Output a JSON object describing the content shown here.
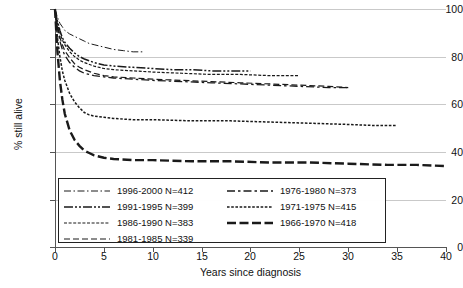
{
  "chart_data": {
    "type": "line",
    "title": "",
    "xlabel": "Years since diagnosis",
    "ylabel": "% still alive",
    "xlim": [
      0,
      40
    ],
    "ylim": [
      0,
      100
    ],
    "xticks": [
      0,
      5,
      10,
      15,
      20,
      25,
      30,
      35,
      40
    ],
    "yticks": [
      0,
      20,
      40,
      60,
      80,
      100
    ],
    "grid": "horizontal",
    "legend_position": "lower-left-inside",
    "series": [
      {
        "name": "1996-2000 N=412",
        "period": "1996-2000",
        "n": 412,
        "dash": "dash-dot-long",
        "x": [
          0,
          0.25,
          0.5,
          0.75,
          1,
          1.5,
          2,
          2.5,
          3,
          3.5,
          4,
          5,
          6,
          7,
          8,
          9
        ],
        "y": [
          100,
          96.5,
          94,
          92.5,
          91,
          89.5,
          88.5,
          87.5,
          86.5,
          85.5,
          85,
          84,
          83,
          82.5,
          82,
          82
        ]
      },
      {
        "name": "1991-1995 N=399",
        "period": "1991-1995",
        "n": 399,
        "dash": "long-dash-dot",
        "x": [
          0,
          0.25,
          0.5,
          0.75,
          1,
          1.5,
          2,
          2.5,
          3,
          4,
          5,
          6,
          8,
          10,
          12,
          14,
          16,
          18,
          20
        ],
        "y": [
          100,
          95,
          91,
          88,
          86,
          83.5,
          81.5,
          80,
          79,
          77.5,
          76.5,
          76,
          75.5,
          75,
          74.5,
          74.5,
          74,
          74,
          74
        ]
      },
      {
        "name": "1986-1990 N=383",
        "period": "1986-1990",
        "n": 383,
        "dash": "dot-dash-fine",
        "x": [
          0,
          0.25,
          0.5,
          0.75,
          1,
          1.5,
          2,
          2.5,
          3,
          4,
          5,
          6,
          8,
          10,
          13,
          16,
          19,
          22,
          25
        ],
        "y": [
          100,
          94,
          90,
          87,
          85,
          82,
          80,
          78.5,
          77.5,
          76,
          75,
          74.5,
          74,
          73.5,
          73,
          72.5,
          72.5,
          72,
          72
        ]
      },
      {
        "name": "1981-1985 N=339",
        "period": "1981-1985",
        "n": 339,
        "dash": "medium-dash",
        "x": [
          0,
          0.25,
          0.5,
          0.75,
          1,
          1.5,
          2,
          2.5,
          3,
          4,
          5,
          6,
          8,
          10,
          13,
          16,
          19,
          22,
          25,
          28,
          30
        ],
        "y": [
          100,
          93,
          88,
          85,
          82.5,
          79.5,
          77,
          75.5,
          74.5,
          73,
          72,
          71.5,
          71,
          70.5,
          70,
          69.5,
          69,
          68.5,
          68,
          67.5,
          67
        ]
      },
      {
        "name": "1976-1980 N=373",
        "period": "1976-1980",
        "n": 373,
        "dash": "long-short-long",
        "x": [
          0,
          0.25,
          0.5,
          0.75,
          1,
          1.5,
          2,
          2.5,
          3,
          4,
          5,
          6,
          8,
          10,
          13,
          16,
          19,
          22,
          25,
          28,
          30
        ],
        "y": [
          100,
          92,
          86.5,
          83,
          80.5,
          77.5,
          75.5,
          74,
          73,
          72,
          71.5,
          71,
          70.5,
          70,
          69.5,
          69,
          68.5,
          68,
          67.5,
          67,
          67
        ]
      },
      {
        "name": "1971-1975 N=415",
        "period": "1971-1975",
        "n": 415,
        "dash": "short-dash-dense",
        "x": [
          0,
          0.25,
          0.5,
          0.75,
          1,
          1.5,
          2,
          2.5,
          3,
          3.5,
          4,
          5,
          6,
          8,
          10,
          14,
          18,
          22,
          26,
          30,
          33,
          35
        ],
        "y": [
          100,
          88,
          80,
          74,
          70,
          64.5,
          61,
          58.5,
          56.5,
          55.5,
          55,
          54.5,
          54,
          53.5,
          53.5,
          53,
          53,
          52.5,
          52,
          51.5,
          51,
          51
        ]
      },
      {
        "name": "1966-1970 N=418",
        "period": "1966-1970",
        "n": 418,
        "dash": "heavy-long-dash",
        "x": [
          0,
          0.25,
          0.5,
          0.75,
          1,
          1.5,
          2,
          2.5,
          3,
          3.5,
          4,
          5,
          6,
          8,
          10,
          14,
          18,
          22,
          26,
          30,
          34,
          37,
          40
        ],
        "y": [
          100,
          82,
          70,
          62,
          56,
          49,
          45,
          42.5,
          40.5,
          39.5,
          38.5,
          37.5,
          37,
          36.5,
          36.5,
          36,
          36,
          35.5,
          35.5,
          35,
          34.5,
          34.5,
          34
        ]
      }
    ]
  },
  "axes": {
    "ylabel": "% still alive",
    "xlabel": "Years since diagnosis",
    "ytick_labels": [
      "0",
      "20",
      "40",
      "60",
      "80",
      "100"
    ],
    "xtick_labels": [
      "0",
      "5",
      "10",
      "15",
      "20",
      "25",
      "30",
      "35",
      "40"
    ]
  },
  "legend": {
    "entries": [
      {
        "label": "1996-2000 N=412",
        "column": 0,
        "row": 0
      },
      {
        "label": "1991-1995 N=399",
        "column": 0,
        "row": 1
      },
      {
        "label": "1986-1990 N=383",
        "column": 0,
        "row": 2
      },
      {
        "label": "1981-1985 N=339",
        "column": 0,
        "row": 3
      },
      {
        "label": "1976-1980 N=373",
        "column": 1,
        "row": 0
      },
      {
        "label": "1971-1975 N=415",
        "column": 1,
        "row": 1
      },
      {
        "label": "1966-1970 N=418",
        "column": 1,
        "row": 2
      }
    ]
  },
  "colors": {
    "line": "#1a1a1a",
    "grid": "#c9c9c9",
    "axis": "#555555",
    "text": "#111111",
    "background": "#ffffff"
  }
}
